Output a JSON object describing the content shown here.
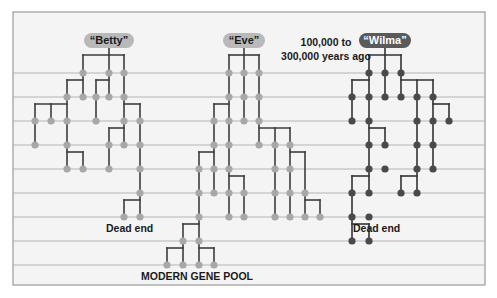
{
  "figure": {
    "frame": {
      "x": 13,
      "y": 12,
      "w": 472,
      "h": 273,
      "border": "#9a9a9a",
      "background": "#f4f4f4"
    },
    "row_lines_y": [
      73,
      97,
      121,
      145,
      169,
      193,
      217,
      241,
      265
    ],
    "row_line_color": "#b4b4b4",
    "colors": {
      "light_node": "#a8a8a8",
      "dark_node": "#4a4a4a",
      "edge": "#3c3c3c"
    },
    "time_label": {
      "line1": "100,000 to",
      "line2": "300,000 years ago"
    },
    "dead_end_label": "Dead end",
    "modern_label": "MODERN GENE POOL"
  },
  "lineages": [
    {
      "name": "“Betty”",
      "tone": "light",
      "root_x": 109,
      "pill": {
        "x": 84,
        "y": 33,
        "w": 50
      },
      "outcome": "Dead end",
      "outcome_pos": {
        "x": 106,
        "y": 222
      },
      "nodes": [
        [
          83,
          73
        ],
        [
          109,
          73
        ],
        [
          124,
          73
        ],
        [
          67,
          97
        ],
        [
          83,
          97
        ],
        [
          96,
          97
        ],
        [
          109,
          97
        ],
        [
          124,
          97
        ],
        [
          35,
          121
        ],
        [
          51,
          121
        ],
        [
          67,
          121
        ],
        [
          96,
          121
        ],
        [
          124,
          121
        ],
        [
          140,
          121
        ],
        [
          35,
          145
        ],
        [
          67,
          145
        ],
        [
          109,
          145
        ],
        [
          124,
          145
        ],
        [
          140,
          145
        ],
        [
          67,
          169
        ],
        [
          83,
          169
        ],
        [
          109,
          169
        ],
        [
          140,
          169
        ],
        [
          140,
          193
        ],
        [
          124,
          217
        ],
        [
          140,
          217
        ]
      ],
      "edges": [
        [
          [
            109,
            48
          ],
          [
            109,
            55
          ]
        ],
        [
          [
            83,
            55
          ],
          [
            124,
            55
          ]
        ],
        [
          [
            83,
            55
          ],
          [
            83,
            73
          ]
        ],
        [
          [
            109,
            55
          ],
          [
            109,
            73
          ]
        ],
        [
          [
            124,
            55
          ],
          [
            124,
            73
          ]
        ],
        [
          [
            83,
            73
          ],
          [
            83,
            97
          ]
        ],
        [
          [
            109,
            73
          ],
          [
            109,
            97
          ]
        ],
        [
          [
            124,
            73
          ],
          [
            124,
            97
          ]
        ],
        [
          [
            67,
            80
          ],
          [
            83,
            80
          ]
        ],
        [
          [
            67,
            80
          ],
          [
            67,
            97
          ]
        ],
        [
          [
            96,
            80
          ],
          [
            109,
            80
          ]
        ],
        [
          [
            96,
            80
          ],
          [
            96,
            97
          ]
        ],
        [
          [
            35,
            104
          ],
          [
            67,
            104
          ]
        ],
        [
          [
            35,
            104
          ],
          [
            35,
            121
          ]
        ],
        [
          [
            51,
            104
          ],
          [
            51,
            121
          ]
        ],
        [
          [
            67,
            97
          ],
          [
            67,
            121
          ]
        ],
        [
          [
            96,
            97
          ],
          [
            96,
            121
          ]
        ],
        [
          [
            124,
            97
          ],
          [
            124,
            121
          ]
        ],
        [
          [
            124,
            104
          ],
          [
            140,
            104
          ]
        ],
        [
          [
            140,
            104
          ],
          [
            140,
            121
          ]
        ],
        [
          [
            35,
            121
          ],
          [
            35,
            145
          ]
        ],
        [
          [
            67,
            121
          ],
          [
            67,
            145
          ]
        ],
        [
          [
            124,
            121
          ],
          [
            124,
            145
          ]
        ],
        [
          [
            140,
            121
          ],
          [
            140,
            145
          ]
        ],
        [
          [
            109,
            128
          ],
          [
            124,
            128
          ]
        ],
        [
          [
            109,
            128
          ],
          [
            109,
            145
          ]
        ],
        [
          [
            67,
            145
          ],
          [
            67,
            169
          ]
        ],
        [
          [
            67,
            152
          ],
          [
            83,
            152
          ]
        ],
        [
          [
            83,
            152
          ],
          [
            83,
            169
          ]
        ],
        [
          [
            109,
            145
          ],
          [
            109,
            169
          ]
        ],
        [
          [
            140,
            145
          ],
          [
            140,
            217
          ]
        ],
        [
          [
            124,
            200
          ],
          [
            140,
            200
          ]
        ],
        [
          [
            124,
            200
          ],
          [
            124,
            217
          ]
        ]
      ]
    },
    {
      "name": "“Eve”",
      "tone": "light",
      "root_x": 244,
      "pill": {
        "x": 223,
        "y": 33,
        "w": 42
      },
      "outcome": "MODERN GENE POOL",
      "outcome_pos": {
        "x": 141,
        "y": 270
      },
      "nodes": [
        [
          229,
          73
        ],
        [
          244,
          73
        ],
        [
          259,
          73
        ],
        [
          229,
          97
        ],
        [
          244,
          97
        ],
        [
          259,
          97
        ],
        [
          214,
          121
        ],
        [
          229,
          121
        ],
        [
          244,
          121
        ],
        [
          259,
          121
        ],
        [
          214,
          145
        ],
        [
          229,
          145
        ],
        [
          259,
          145
        ],
        [
          275,
          145
        ],
        [
          290,
          145
        ],
        [
          199,
          169
        ],
        [
          214,
          169
        ],
        [
          229,
          169
        ],
        [
          275,
          169
        ],
        [
          290,
          169
        ],
        [
          199,
          193
        ],
        [
          214,
          193
        ],
        [
          229,
          193
        ],
        [
          244,
          193
        ],
        [
          275,
          193
        ],
        [
          290,
          193
        ],
        [
          305,
          193
        ],
        [
          199,
          217
        ],
        [
          229,
          217
        ],
        [
          244,
          217
        ],
        [
          275,
          217
        ],
        [
          290,
          217
        ],
        [
          305,
          217
        ],
        [
          320,
          217
        ],
        [
          183,
          241
        ],
        [
          199,
          241
        ],
        [
          167,
          265
        ],
        [
          183,
          265
        ],
        [
          199,
          265
        ],
        [
          214,
          265
        ]
      ],
      "edges": [
        [
          [
            244,
            48
          ],
          [
            244,
            55
          ]
        ],
        [
          [
            229,
            55
          ],
          [
            259,
            55
          ]
        ],
        [
          [
            229,
            55
          ],
          [
            229,
            73
          ]
        ],
        [
          [
            244,
            55
          ],
          [
            244,
            73
          ]
        ],
        [
          [
            259,
            55
          ],
          [
            259,
            73
          ]
        ],
        [
          [
            229,
            73
          ],
          [
            229,
            145
          ]
        ],
        [
          [
            244,
            73
          ],
          [
            244,
            121
          ]
        ],
        [
          [
            259,
            73
          ],
          [
            259,
            145
          ]
        ],
        [
          [
            214,
            104
          ],
          [
            229,
            104
          ]
        ],
        [
          [
            214,
            104
          ],
          [
            214,
            121
          ]
        ],
        [
          [
            214,
            121
          ],
          [
            214,
            193
          ]
        ],
        [
          [
            259,
            128
          ],
          [
            290,
            128
          ]
        ],
        [
          [
            275,
            128
          ],
          [
            275,
            145
          ]
        ],
        [
          [
            290,
            128
          ],
          [
            290,
            145
          ]
        ],
        [
          [
            199,
            152
          ],
          [
            214,
            152
          ]
        ],
        [
          [
            199,
            152
          ],
          [
            199,
            241
          ]
        ],
        [
          [
            229,
            145
          ],
          [
            229,
            217
          ]
        ],
        [
          [
            275,
            145
          ],
          [
            275,
            217
          ]
        ],
        [
          [
            290,
            145
          ],
          [
            290,
            217
          ]
        ],
        [
          [
            290,
            152
          ],
          [
            305,
            152
          ]
        ],
        [
          [
            305,
            152
          ],
          [
            305,
            193
          ]
        ],
        [
          [
            229,
            176
          ],
          [
            244,
            176
          ]
        ],
        [
          [
            244,
            176
          ],
          [
            244,
            217
          ]
        ],
        [
          [
            305,
            200
          ],
          [
            320,
            200
          ]
        ],
        [
          [
            305,
            193
          ],
          [
            305,
            217
          ]
        ],
        [
          [
            320,
            200
          ],
          [
            320,
            217
          ]
        ],
        [
          [
            183,
            224
          ],
          [
            199,
            224
          ]
        ],
        [
          [
            183,
            224
          ],
          [
            183,
            265
          ]
        ],
        [
          [
            199,
            241
          ],
          [
            199,
            265
          ]
        ],
        [
          [
            167,
            248
          ],
          [
            183,
            248
          ]
        ],
        [
          [
            167,
            248
          ],
          [
            167,
            265
          ]
        ],
        [
          [
            199,
            248
          ],
          [
            214,
            248
          ]
        ],
        [
          [
            214,
            248
          ],
          [
            214,
            265
          ]
        ]
      ]
    },
    {
      "name": "“Wilma”",
      "tone": "dark",
      "root_x": 385,
      "pill": {
        "x": 359,
        "y": 33,
        "w": 52
      },
      "outcome": "Dead end",
      "outcome_pos": {
        "x": 353,
        "y": 222
      },
      "nodes": [
        [
          369,
          73
        ],
        [
          385,
          73
        ],
        [
          401,
          73
        ],
        [
          352,
          97
        ],
        [
          369,
          97
        ],
        [
          385,
          97
        ],
        [
          401,
          97
        ],
        [
          417,
          97
        ],
        [
          433,
          97
        ],
        [
          352,
          121
        ],
        [
          369,
          121
        ],
        [
          417,
          121
        ],
        [
          433,
          121
        ],
        [
          449,
          121
        ],
        [
          369,
          145
        ],
        [
          385,
          145
        ],
        [
          417,
          145
        ],
        [
          433,
          145
        ],
        [
          369,
          169
        ],
        [
          385,
          169
        ],
        [
          417,
          169
        ],
        [
          433,
          169
        ],
        [
          352,
          193
        ],
        [
          369,
          193
        ],
        [
          401,
          193
        ],
        [
          417,
          193
        ],
        [
          352,
          217
        ],
        [
          369,
          217
        ],
        [
          352,
          241
        ],
        [
          369,
          241
        ]
      ],
      "edges": [
        [
          [
            385,
            48
          ],
          [
            385,
            55
          ]
        ],
        [
          [
            369,
            55
          ],
          [
            401,
            55
          ]
        ],
        [
          [
            369,
            55
          ],
          [
            369,
            73
          ]
        ],
        [
          [
            385,
            55
          ],
          [
            385,
            73
          ]
        ],
        [
          [
            401,
            55
          ],
          [
            401,
            73
          ]
        ],
        [
          [
            369,
            73
          ],
          [
            369,
            169
          ]
        ],
        [
          [
            385,
            73
          ],
          [
            385,
            97
          ]
        ],
        [
          [
            401,
            73
          ],
          [
            401,
            97
          ]
        ],
        [
          [
            352,
            80
          ],
          [
            369,
            80
          ]
        ],
        [
          [
            352,
            80
          ],
          [
            352,
            121
          ]
        ],
        [
          [
            401,
            80
          ],
          [
            433,
            80
          ]
        ],
        [
          [
            417,
            80
          ],
          [
            417,
            97
          ]
        ],
        [
          [
            433,
            80
          ],
          [
            433,
            97
          ]
        ],
        [
          [
            417,
            97
          ],
          [
            417,
            193
          ]
        ],
        [
          [
            433,
            97
          ],
          [
            433,
            169
          ]
        ],
        [
          [
            433,
            104
          ],
          [
            449,
            104
          ]
        ],
        [
          [
            449,
            104
          ],
          [
            449,
            121
          ]
        ],
        [
          [
            369,
            128
          ],
          [
            385,
            128
          ]
        ],
        [
          [
            385,
            128
          ],
          [
            385,
            145
          ]
        ],
        [
          [
            352,
            176
          ],
          [
            369,
            176
          ]
        ],
        [
          [
            352,
            176
          ],
          [
            352,
            241
          ]
        ],
        [
          [
            369,
            169
          ],
          [
            369,
            193
          ]
        ],
        [
          [
            401,
            176
          ],
          [
            417,
            176
          ]
        ],
        [
          [
            401,
            176
          ],
          [
            401,
            193
          ]
        ],
        [
          [
            352,
            224
          ],
          [
            369,
            224
          ]
        ],
        [
          [
            369,
            224
          ],
          [
            369,
            241
          ]
        ]
      ]
    }
  ]
}
